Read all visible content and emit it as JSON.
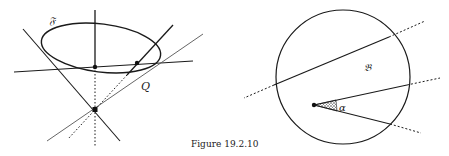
{
  "figure": {
    "caption": "Figure 19.2.10",
    "left_panel": {
      "labels": {
        "surface": "𝔉",
        "point_q": "Q"
      },
      "elements": [
        "ellipse",
        "vertical-axis",
        "cone-generator-left",
        "cone-generator-right",
        "plane-trace-line",
        "secant-line",
        "apex-point",
        "ellipse-center-point",
        "intersection-point"
      ]
    },
    "right_panel": {
      "labels": {
        "region": "𝔅",
        "angle": "α"
      },
      "elements": [
        "circle",
        "chord-line",
        "ray-upper",
        "ray-lower",
        "vertex-point",
        "shaded-angle-sector"
      ]
    },
    "colors": {
      "stroke": "#1a1a1a",
      "background": "#ffffff",
      "dotted": "#333333"
    }
  }
}
